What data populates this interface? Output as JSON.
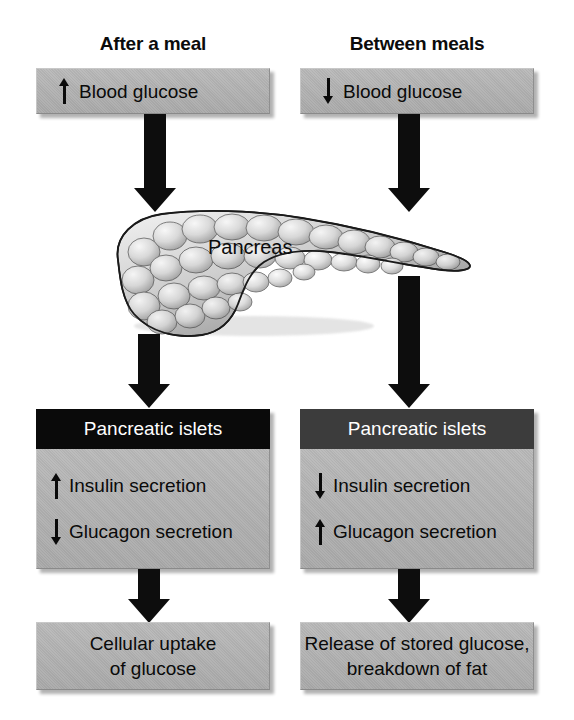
{
  "diagram": {
    "colors": {
      "box_fill": "#b2b2b2",
      "islet_header_left": "#0a0a0a",
      "islet_header_right": "#3c3c3c",
      "arrow": "#0d0d0d",
      "text": "#0a0a0a",
      "header_text": "#ffffff",
      "background": "#ffffff"
    }
  },
  "columns": {
    "left": {
      "header": "After a meal",
      "stimulus": {
        "direction": "up",
        "label": "Blood glucose"
      },
      "islets": {
        "header": "Pancreatic islets",
        "lines": [
          {
            "direction": "up",
            "label": "Insulin secretion"
          },
          {
            "direction": "down",
            "label": "Glucagon secretion"
          }
        ]
      },
      "outcome": {
        "line1": "Cellular uptake",
        "line2": "of glucose"
      }
    },
    "right": {
      "header": "Between meals",
      "stimulus": {
        "direction": "down",
        "label": "Blood glucose"
      },
      "islets": {
        "header": "Pancreatic islets",
        "lines": [
          {
            "direction": "down",
            "label": "Insulin secretion"
          },
          {
            "direction": "up",
            "label": "Glucagon secretion"
          }
        ]
      },
      "outcome": {
        "line1": "Release of stored glucose,",
        "line2": "breakdown of fat"
      }
    }
  },
  "organ": {
    "label": "Pancreas"
  }
}
